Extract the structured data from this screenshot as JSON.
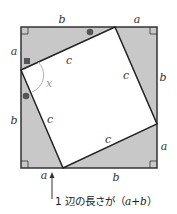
{
  "diagram": {
    "outer_square": {
      "x": 21,
      "y": 27,
      "size": 136
    },
    "inner_square_corners": [
      [
        115,
        27
      ],
      [
        157,
        124
      ],
      [
        63,
        168
      ],
      [
        21,
        70
      ]
    ],
    "colors": {
      "triangle_fill": "#c8c8c8",
      "inner_fill": "#ffffff",
      "stroke": "#333333",
      "marker": "#555555",
      "angle_arc": "#aaaaaa"
    },
    "labels": {
      "top_b": "b",
      "top_a": "a",
      "left_a": "a",
      "left_b": "b",
      "right_b": "b",
      "right_a": "a",
      "bottom_a": "a",
      "bottom_b": "b",
      "c_top": "c",
      "c_right": "c",
      "c_left": "c",
      "c_bottom": "c",
      "angle": "x"
    },
    "caption": {
      "prefix": "1 辺の長さが（",
      "var_a": "a",
      "plus": "+",
      "var_b": "b",
      "suffix": "）"
    }
  }
}
